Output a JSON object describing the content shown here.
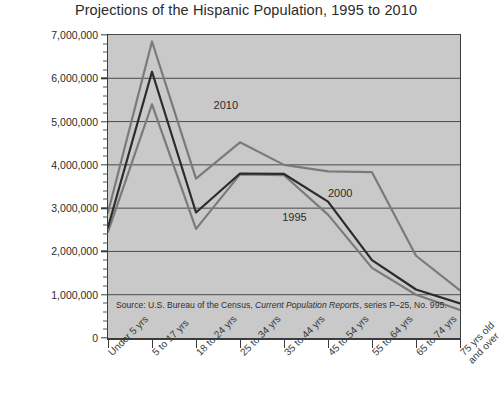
{
  "chart_data": {
    "type": "line",
    "title": "Projections of the Hispanic Population, 1995 to 2010",
    "xlabel": "",
    "ylabel": "",
    "ylim": [
      0,
      7000000
    ],
    "ytick_step": 1000000,
    "yticks": [
      "0",
      "1,000,000",
      "2,000,000",
      "3,000,000",
      "4,000,000",
      "5,000,000",
      "6,000,000",
      "7,000,000"
    ],
    "minor_ticks": true,
    "grid": "horizontal",
    "legend_position": "inline-annotations",
    "plot_background": "#c9c9c9",
    "categories": [
      "Under 5 yrs",
      "5 to 17 yrs",
      "18 to 24 yrs",
      "25 to 34 yrs",
      "35 to 44 yrs",
      "45 to 54 yrs",
      "55 to 64 yrs",
      "65 to 74 yrs",
      "75 yrs old\nand over"
    ],
    "series": [
      {
        "name": "1995",
        "color": "#7a7a7a",
        "values": [
          2450000,
          5400000,
          2520000,
          3780000,
          3760000,
          2850000,
          1620000,
          1000000,
          650000
        ]
      },
      {
        "name": "2000",
        "color": "#2b2b2b",
        "values": [
          2560000,
          6150000,
          2900000,
          3800000,
          3790000,
          3150000,
          1800000,
          1120000,
          800000
        ]
      },
      {
        "name": "2010",
        "color": "#7a7a7a",
        "values": [
          2900000,
          6850000,
          3680000,
          4520000,
          4000000,
          3850000,
          3830000,
          1900000,
          1100000
        ]
      }
    ],
    "annotations": [
      {
        "label": "2010",
        "x_frac": 0.3,
        "value": 5350000
      },
      {
        "label": "2000",
        "x_frac": 0.625,
        "value": 3330000
      },
      {
        "label": "1995",
        "x_frac": 0.495,
        "value": 2780000
      }
    ],
    "source_prefix": "Source: U.S. Bureau of the Census, ",
    "source_italic": "Current Population Reports",
    "source_suffix": ", series P–25, No. 995."
  }
}
